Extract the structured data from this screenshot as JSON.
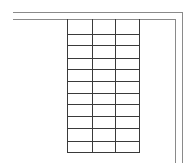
{
  "diagram": {
    "colors": {
      "border": "#8a8a8a",
      "grid": "#3a3a3a",
      "background": "#ffffff"
    },
    "outer_border": {
      "top_y": 12,
      "left_x": 13,
      "right_x": 182,
      "bottom_y": 163
    },
    "inner_border": {
      "top_y": 19,
      "left_x": 13,
      "right_x": 175,
      "bottom_y": 163
    },
    "grid": {
      "left": 67,
      "column_lines_x": [
        67,
        92,
        115,
        139
      ],
      "row_lines_y": [
        19,
        34,
        45,
        58,
        69,
        81,
        93,
        104,
        116,
        128,
        141,
        152
      ],
      "columns": 3,
      "rows": 11
    }
  }
}
